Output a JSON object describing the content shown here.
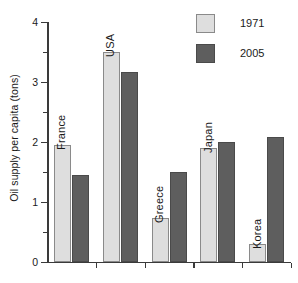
{
  "chart_data": {
    "type": "bar",
    "title": "",
    "xlabel": "",
    "ylabel": "Oil supply per capita (tons)",
    "ylim": [
      0,
      4
    ],
    "grid": false,
    "legend_position": "top-right",
    "categories": [
      "France",
      "USA",
      "Greece",
      "Japan",
      "Korea"
    ],
    "y_ticks": [
      "0",
      "1",
      "2",
      "3",
      "4"
    ],
    "y_tick_values": [
      0,
      1,
      2,
      3,
      4
    ],
    "y_minor_tick_values": [
      0.5,
      1.5,
      2.5,
      3.5
    ],
    "series": [
      {
        "name": "1971",
        "color": "#dedede",
        "values": [
          1.95,
          3.5,
          0.73,
          1.9,
          0.3
        ]
      },
      {
        "name": "2005",
        "color": "#5e5e5e",
        "values": [
          1.45,
          3.17,
          1.5,
          2.0,
          2.08
        ]
      }
    ]
  },
  "legend": {
    "items": [
      {
        "label": "1971",
        "color": "#dedede"
      },
      {
        "label": "2005",
        "color": "#5e5e5e"
      }
    ]
  },
  "axis": {
    "y_label": "Oil supply per capita (tons)"
  }
}
